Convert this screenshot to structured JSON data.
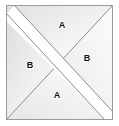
{
  "figure": {
    "canvas": {
      "width": 119,
      "height": 126,
      "background": "#ffffff"
    },
    "square": {
      "left": 6,
      "top": 5,
      "right": 113,
      "bottom": 120,
      "stroke": "#9a9a9a",
      "stroke_width": 1,
      "fill_light": "#fdfdfd",
      "fill_dark": "#e3e3e3"
    },
    "band": {
      "name": "white-diagonal-band",
      "from": "top-left",
      "to": "bottom-right",
      "fill": "#ffffff",
      "stroke": "#8d8d8d",
      "half_width": 6
    },
    "diagonal": {
      "name": "anti-diagonal",
      "from": "top-right",
      "to": "bottom-left",
      "stroke": "#8d8d8d",
      "stroke_width": 1
    },
    "labels": [
      {
        "id": "top",
        "text": "A",
        "x": 62,
        "y": 26
      },
      {
        "id": "right",
        "text": "B",
        "x": 87,
        "y": 59
      },
      {
        "id": "bottom",
        "text": "A",
        "x": 57,
        "y": 96
      },
      {
        "id": "left",
        "text": "B",
        "x": 30,
        "y": 66
      }
    ]
  }
}
